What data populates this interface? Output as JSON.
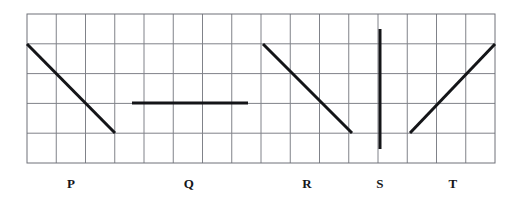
{
  "figure": {
    "canvas": {
      "width": 514,
      "height": 208,
      "background": "#ffffff"
    },
    "grid": {
      "x": 27,
      "y": 14,
      "cols": 16,
      "rows": 5,
      "cell_width": 29.25,
      "cell_height": 29.8,
      "line_color": "#808289",
      "line_width": 1,
      "border_color": "#6f7178",
      "border_width": 1
    },
    "stroke": {
      "color": "#141518",
      "width": 3,
      "cap": "butt"
    },
    "segments": [
      {
        "id": "P",
        "name": "segment-p",
        "description": "descending diagonal, down-right",
        "x1": 27,
        "y1": 44,
        "x2": 115,
        "y2": 133,
        "grid_start": [
          0,
          1
        ],
        "grid_end": [
          3,
          4
        ],
        "slope": "-1"
      },
      {
        "id": "Q",
        "name": "segment-q",
        "description": "horizontal line",
        "x1": 132,
        "y1": 103,
        "x2": 248,
        "y2": 103,
        "grid_start": [
          3.6,
          3
        ],
        "grid_end": [
          7.55,
          3
        ],
        "slope": "0"
      },
      {
        "id": "R",
        "name": "segment-r",
        "description": "descending diagonal, down-right",
        "x1": 263,
        "y1": 44,
        "x2": 352,
        "y2": 133,
        "grid_start": [
          8.07,
          1
        ],
        "grid_end": [
          11.11,
          4
        ],
        "slope": "-1"
      },
      {
        "id": "S",
        "name": "segment-s",
        "description": "vertical line",
        "x1": 380,
        "y1": 29,
        "x2": 380,
        "y2": 149,
        "grid_start": [
          12.07,
          0.5
        ],
        "grid_end": [
          12.07,
          4.53
        ],
        "slope": "undefined"
      },
      {
        "id": "T",
        "name": "segment-t",
        "description": "ascending diagonal, up-right",
        "x1": 410,
        "y1": 133,
        "x2": 495,
        "y2": 44,
        "grid_start": [
          13.09,
          4
        ],
        "grid_end": [
          16,
          1
        ],
        "slope": "+1"
      }
    ],
    "labels": [
      {
        "text": "P",
        "x": 71,
        "y": 184
      },
      {
        "text": "Q",
        "x": 189,
        "y": 184
      },
      {
        "text": "R",
        "x": 307,
        "y": 184
      },
      {
        "text": "S",
        "x": 380,
        "y": 184
      },
      {
        "text": "T",
        "x": 453,
        "y": 184
      }
    ]
  }
}
